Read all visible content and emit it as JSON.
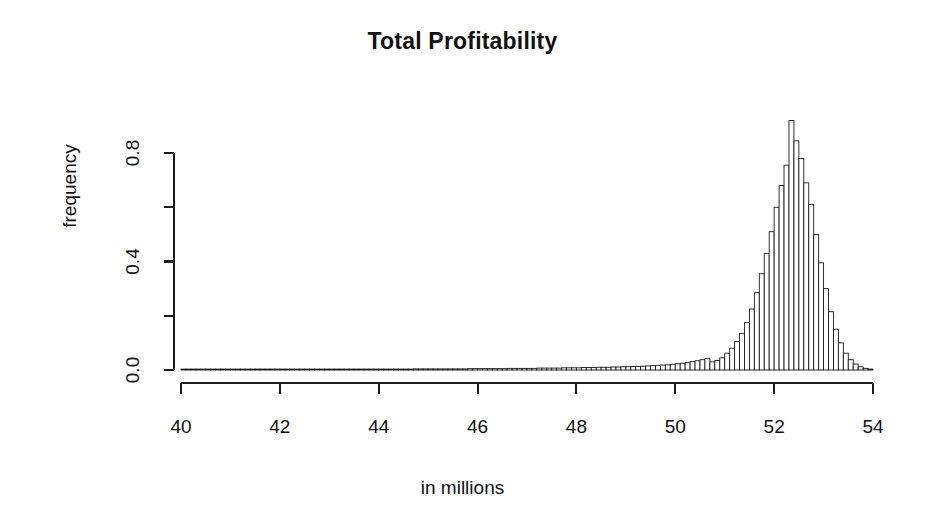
{
  "figure": {
    "background": "#ffffff",
    "foreground": "#1a1a1a"
  },
  "chart_data": {
    "type": "bar",
    "title": "Total Profitability",
    "xlabel": "in millions",
    "ylabel": "frequency",
    "grid": false,
    "legend": null,
    "xlim": [
      40,
      54
    ],
    "ylim": [
      0,
      0.95
    ],
    "xticks": [
      40,
      42,
      44,
      46,
      48,
      50,
      52,
      54
    ],
    "xticklabels": [
      "40",
      "42",
      "44",
      "46",
      "48",
      "50",
      "52",
      "54"
    ],
    "yticks": [
      0.0,
      0.2,
      0.4,
      0.6,
      0.8
    ],
    "yticklabels": [
      "0.0",
      "",
      "0.4",
      "",
      "0.8"
    ],
    "bin_width": 0.1,
    "bin_starts": [
      40.0,
      40.1,
      40.2,
      40.3,
      40.4,
      40.5,
      40.6,
      40.7,
      40.8,
      40.9,
      41.0,
      41.1,
      41.2,
      41.3,
      41.4,
      41.5,
      41.6,
      41.7,
      41.8,
      41.9,
      42.0,
      42.1,
      42.2,
      42.3,
      42.4,
      42.5,
      42.6,
      42.7,
      42.8,
      42.9,
      43.0,
      43.1,
      43.2,
      43.3,
      43.4,
      43.5,
      43.6,
      43.7,
      43.8,
      43.9,
      44.0,
      44.1,
      44.2,
      44.3,
      44.4,
      44.5,
      44.6,
      44.7,
      44.8,
      44.9,
      45.0,
      45.1,
      45.2,
      45.3,
      45.4,
      45.5,
      45.6,
      45.7,
      45.8,
      45.9,
      46.0,
      46.1,
      46.2,
      46.3,
      46.4,
      46.5,
      46.6,
      46.7,
      46.8,
      46.9,
      47.0,
      47.1,
      47.2,
      47.3,
      47.4,
      47.5,
      47.6,
      47.7,
      47.8,
      47.9,
      48.0,
      48.1,
      48.2,
      48.3,
      48.4,
      48.5,
      48.6,
      48.7,
      48.8,
      48.9,
      49.0,
      49.1,
      49.2,
      49.3,
      49.4,
      49.5,
      49.6,
      49.7,
      49.8,
      49.9,
      50.0,
      50.1,
      50.2,
      50.3,
      50.4,
      50.5,
      50.6,
      50.7,
      50.8,
      50.9,
      51.0,
      51.1,
      51.2,
      51.3,
      51.4,
      51.5,
      51.6,
      51.7,
      51.8,
      51.9,
      52.0,
      52.1,
      52.2,
      52.3,
      52.4,
      52.5,
      52.6,
      52.7,
      52.8,
      52.9,
      53.0,
      53.1,
      53.2,
      53.3,
      53.4,
      53.5,
      53.6,
      53.7,
      53.8,
      53.9
    ],
    "values": [
      0.002,
      0.002,
      0.002,
      0.002,
      0.002,
      0.002,
      0.002,
      0.002,
      0.002,
      0.002,
      0.002,
      0.002,
      0.002,
      0.002,
      0.002,
      0.002,
      0.002,
      0.002,
      0.002,
      0.002,
      0.002,
      0.002,
      0.002,
      0.002,
      0.002,
      0.002,
      0.002,
      0.002,
      0.002,
      0.003,
      0.003,
      0.003,
      0.003,
      0.003,
      0.003,
      0.003,
      0.003,
      0.003,
      0.003,
      0.003,
      0.003,
      0.003,
      0.003,
      0.003,
      0.003,
      0.003,
      0.003,
      0.004,
      0.004,
      0.004,
      0.004,
      0.004,
      0.004,
      0.004,
      0.004,
      0.004,
      0.004,
      0.004,
      0.005,
      0.005,
      0.005,
      0.005,
      0.005,
      0.005,
      0.005,
      0.005,
      0.006,
      0.006,
      0.006,
      0.006,
      0.006,
      0.006,
      0.007,
      0.007,
      0.007,
      0.007,
      0.007,
      0.008,
      0.008,
      0.008,
      0.008,
      0.009,
      0.009,
      0.009,
      0.01,
      0.01,
      0.01,
      0.011,
      0.011,
      0.012,
      0.012,
      0.013,
      0.013,
      0.014,
      0.015,
      0.016,
      0.017,
      0.018,
      0.019,
      0.021,
      0.023,
      0.025,
      0.028,
      0.031,
      0.034,
      0.038,
      0.043,
      0.03,
      0.035,
      0.045,
      0.062,
      0.08,
      0.105,
      0.135,
      0.175,
      0.225,
      0.285,
      0.355,
      0.43,
      0.51,
      0.6,
      0.68,
      0.755,
      0.92,
      0.845,
      0.78,
      0.69,
      0.61,
      0.5,
      0.395,
      0.3,
      0.215,
      0.15,
      0.1,
      0.062,
      0.038,
      0.022,
      0.012,
      0.006,
      0.003
    ],
    "peak": {
      "x": 52.3,
      "y": 0.92
    }
  },
  "axes": {
    "x_axis_name": "x-axis",
    "y_axis_name": "y-axis"
  }
}
